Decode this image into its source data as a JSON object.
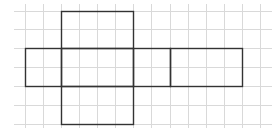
{
  "diagram": {
    "type": "cube-net-on-grid",
    "canvas": {
      "width": 278,
      "height": 132,
      "background": "#ffffff"
    },
    "grid": {
      "color": "#d9d9d9",
      "x_lines": [
        25,
        43,
        61,
        79,
        97,
        115,
        133,
        151,
        170,
        188,
        206,
        224,
        242,
        260
      ],
      "y_lines": [
        11,
        29,
        48,
        67,
        86,
        105,
        124
      ],
      "x_extent": [
        14,
        272
      ],
      "y_extent": [
        4,
        128
      ]
    },
    "outline": {
      "color": "#333333",
      "stroke_width": 1.4,
      "faces": [
        {
          "name": "top-face",
          "x": 61,
          "y": 11,
          "w": 72,
          "h": 37
        },
        {
          "name": "left-face",
          "x": 25,
          "y": 48,
          "w": 36,
          "h": 38
        },
        {
          "name": "center-face",
          "x": 61,
          "y": 48,
          "w": 72,
          "h": 38
        },
        {
          "name": "middle-right-face",
          "x": 133,
          "y": 48,
          "w": 37,
          "h": 38
        },
        {
          "name": "far-right-face",
          "x": 170,
          "y": 48,
          "w": 72,
          "h": 38
        },
        {
          "name": "bottom-face",
          "x": 61,
          "y": 86,
          "w": 72,
          "h": 38
        }
      ]
    }
  }
}
